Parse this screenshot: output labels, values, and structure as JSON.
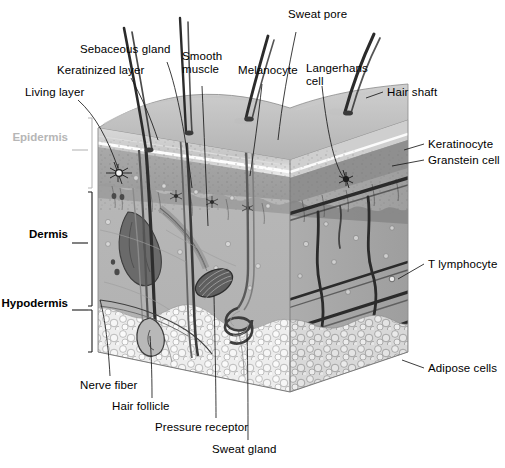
{
  "figure": {
    "type": "anatomical-diagram",
    "style": "grayscale halftone illustration",
    "background_color": "#ffffff",
    "label_color": "#000000",
    "faded_label_color": "#b6b6b6"
  },
  "layer_labels": [
    {
      "id": "epidermis",
      "text": "Epidermis",
      "emphasis": "faded"
    },
    {
      "id": "dermis",
      "text": "Dermis",
      "emphasis": "bold"
    },
    {
      "id": "hypodermis",
      "text": "Hypodermis",
      "emphasis": "bold"
    }
  ],
  "callouts": {
    "top_left": [
      {
        "id": "living-layer",
        "text": "Living layer"
      },
      {
        "id": "keratinized-layer",
        "text": "Keratinized layer"
      },
      {
        "id": "sebaceous-gland",
        "text": "Sebaceous gland"
      }
    ],
    "top_center": [
      {
        "id": "smooth-muscle",
        "text": "Smooth\nmuscle"
      },
      {
        "id": "melanocyte",
        "text": "Melanocyte"
      },
      {
        "id": "sweat-pore",
        "text": "Sweat pore"
      },
      {
        "id": "langerhans-cell",
        "text": "Langerhans\ncell"
      },
      {
        "id": "hair-shaft",
        "text": "Hair shaft"
      }
    ],
    "right": [
      {
        "id": "keratinocyte",
        "text": "Keratinocyte"
      },
      {
        "id": "granstein-cell",
        "text": "Granstein cell"
      },
      {
        "id": "t-lymphocyte",
        "text": "T lymphocyte"
      },
      {
        "id": "adipose-cells",
        "text": "Adipose cells"
      }
    ],
    "bottom": [
      {
        "id": "nerve-fiber",
        "text": "Nerve fiber"
      },
      {
        "id": "hair-follicle",
        "text": "Hair follicle"
      },
      {
        "id": "pressure-receptor",
        "text": "Pressure receptor"
      },
      {
        "id": "sweat-gland",
        "text": "Sweat gland"
      }
    ]
  }
}
